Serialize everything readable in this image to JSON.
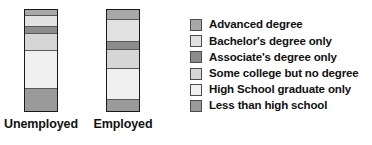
{
  "chart_data": {
    "type": "bar",
    "subtype": "100% stacked bar",
    "title": "",
    "xlabel": "",
    "ylabel": "",
    "ylim": [
      0,
      100
    ],
    "grid": false,
    "legend_position": "right",
    "categories": [
      "Unemployed",
      "Employed"
    ],
    "series": [
      {
        "name": "Advanced degree",
        "color": "#a8a8a8",
        "values": [
          5,
          9
        ]
      },
      {
        "name": "Bachelor's degree only",
        "color": "#e2e2e2",
        "values": [
          11,
          22
        ]
      },
      {
        "name": "Associate's degree only",
        "color": "#8c8c8c",
        "values": [
          6,
          8
        ]
      },
      {
        "name": "Some college but no degree",
        "color": "#d6d6d6",
        "values": [
          17,
          18
        ]
      },
      {
        "name": "High School graduate only",
        "color": "#f0f0f0",
        "values": [
          38,
          32
        ]
      },
      {
        "name": "Less than high school",
        "color": "#9a9a9a",
        "values": [
          23,
          11
        ]
      }
    ],
    "stack_order": "top-to-bottom",
    "annotations": []
  },
  "legend": {
    "items": [
      {
        "label": "Advanced degree",
        "color": "#a8a8a8"
      },
      {
        "label": "Bachelor's degree only",
        "color": "#e2e2e2"
      },
      {
        "label": "Associate's degree only",
        "color": "#8c8c8c"
      },
      {
        "label": "Some college but no degree",
        "color": "#d6d6d6"
      },
      {
        "label": "High School graduate only",
        "color": "#f0f0f0"
      },
      {
        "label": "Less than high school",
        "color": "#9a9a9a"
      }
    ]
  },
  "axis": {
    "category_labels": [
      "Unemployed",
      "Employed"
    ]
  },
  "style": {
    "background": "#ffffff",
    "bar_outline": "#1a1a1a",
    "segment_divider": "#58585a",
    "text_color": "#111111"
  }
}
